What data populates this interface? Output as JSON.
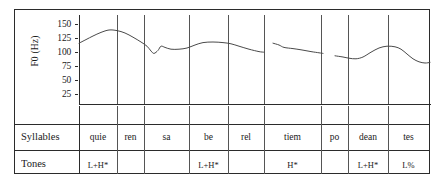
{
  "figure": {
    "axis_label": "F0 (Hz)",
    "y_ticks": [
      "150",
      "125",
      "100",
      "75",
      "50",
      "25"
    ],
    "row_labels": {
      "syllables": "Syllables",
      "tones": "Tones"
    }
  },
  "syllables": [
    {
      "text": "quie",
      "tone": "L+H*"
    },
    {
      "text": "ren",
      "tone": ""
    },
    {
      "text": "sa",
      "tone": ""
    },
    {
      "text": "be",
      "tone": "L+H*"
    },
    {
      "text": "rel",
      "tone": ""
    },
    {
      "text": "tiem",
      "tone": "H*"
    },
    {
      "text": "po",
      "tone": ""
    },
    {
      "text": "dean",
      "tone": "L+H*"
    },
    {
      "text": "tes",
      "tone": "L%"
    }
  ],
  "chart_data": {
    "type": "line",
    "title": "",
    "xlabel": "",
    "ylabel": "F0 (Hz)",
    "ylim": [
      25,
      155
    ],
    "ytick_values": [
      150,
      125,
      100,
      75,
      50,
      25
    ],
    "grid": false,
    "legend": "none",
    "x_category_boundaries_px": [
      78,
      116,
      143,
      188,
      227,
      263,
      320,
      347,
      387,
      430
    ],
    "series": [
      {
        "name": "F0 contour (segment 1: quie-ren-sa-be-rel)",
        "points": [
          [
            78,
            118
          ],
          [
            85,
            124
          ],
          [
            92,
            130
          ],
          [
            100,
            136
          ],
          [
            108,
            140
          ],
          [
            116,
            139
          ],
          [
            124,
            135
          ],
          [
            132,
            128
          ],
          [
            140,
            120
          ],
          [
            146,
            113
          ],
          [
            150,
            105
          ],
          [
            153,
            101
          ],
          [
            157,
            106
          ],
          [
            160,
            113
          ],
          [
            164,
            111
          ],
          [
            170,
            108
          ],
          [
            178,
            108
          ],
          [
            186,
            110
          ],
          [
            194,
            115
          ],
          [
            202,
            119
          ],
          [
            212,
            120
          ],
          [
            222,
            119
          ],
          [
            230,
            117
          ],
          [
            238,
            113
          ],
          [
            248,
            108
          ],
          [
            258,
            104
          ],
          [
            263,
            103
          ]
        ]
      },
      {
        "name": "F0 contour (segment 2: tiem)",
        "points": [
          [
            272,
            118
          ],
          [
            278,
            115
          ],
          [
            283,
            111
          ],
          [
            292,
            109
          ],
          [
            300,
            107
          ],
          [
            310,
            104
          ],
          [
            318,
            102
          ],
          [
            322,
            101
          ]
        ]
      },
      {
        "name": "F0 contour (segment 3: po-dean-tes)",
        "points": [
          [
            334,
            97
          ],
          [
            342,
            95
          ],
          [
            348,
            93
          ],
          [
            355,
            92
          ],
          [
            362,
            95
          ],
          [
            370,
            103
          ],
          [
            378,
            110
          ],
          [
            386,
            113
          ],
          [
            394,
            112
          ],
          [
            400,
            108
          ],
          [
            406,
            100
          ],
          [
            412,
            92
          ],
          [
            418,
            87
          ],
          [
            424,
            85
          ],
          [
            429,
            86
          ]
        ]
      }
    ]
  }
}
